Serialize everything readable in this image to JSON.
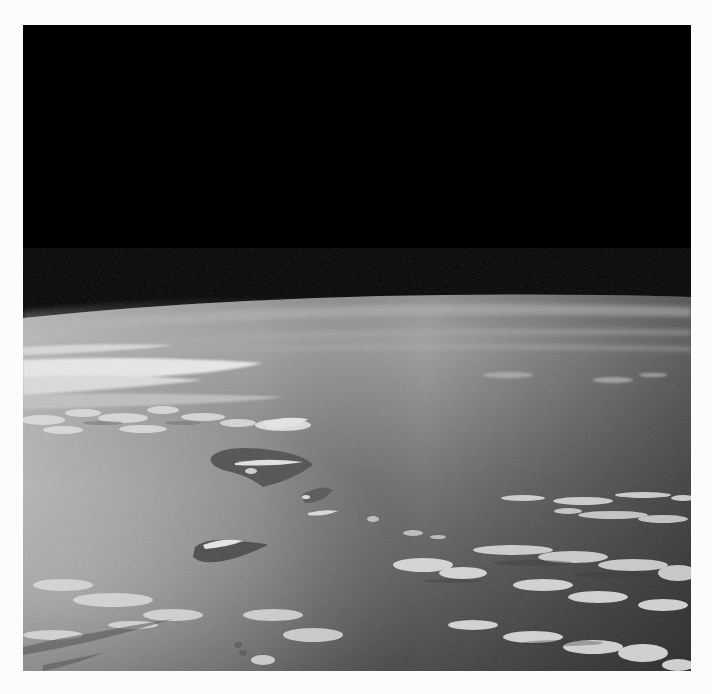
{
  "image": {
    "subject": "earth-horizon-from-orbit",
    "frame": {
      "left": 23,
      "top": 25,
      "width": 668,
      "height": 646
    },
    "colors": {
      "page_background": "#fcfcfc",
      "space": "#000000",
      "limb_glow": "#8e8e8e",
      "haze_far": "#9c9c9c",
      "ocean_mid": "#6e6e6e",
      "ocean_near_right": "#3e3e3e",
      "sunglint_left": "#b8b8b8",
      "cloud": "#e6e6e6",
      "island": "#4a4a4a"
    },
    "elements": [
      "black-space",
      "curved-horizon",
      "atmospheric-haze",
      "cloud-band-upper-left",
      "island-chain",
      "cumulus-cloud-streets",
      "sunglint-lower-left"
    ]
  }
}
